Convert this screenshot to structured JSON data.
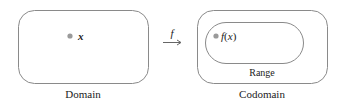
{
  "diagram": {
    "domain": {
      "label": "Domain",
      "point_label": "x"
    },
    "mapping": {
      "label": "f",
      "arrow": "maps-to-arrow"
    },
    "codomain": {
      "label": "Codomain",
      "range": {
        "label": "Range",
        "point_label": "f(x)"
      }
    },
    "colors": {
      "stroke": "#8a8a8a",
      "dot": "#9a9a9a",
      "text": "#222222"
    }
  }
}
